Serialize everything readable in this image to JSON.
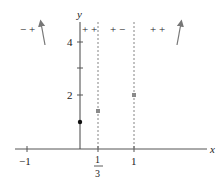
{
  "diagram": {
    "axes": {
      "x_label": "x",
      "y_label": "y",
      "x_ticks": [
        {
          "value": -1,
          "label": "−1"
        },
        {
          "value": 0.3333,
          "label_num": "1",
          "label_den": "3"
        },
        {
          "value": 1,
          "label": "1"
        }
      ],
      "y_ticks": [
        {
          "value": 2,
          "label": "2"
        },
        {
          "value": 3,
          "label": ""
        },
        {
          "value": 4,
          "label": "4"
        }
      ]
    },
    "sign_regions": [
      {
        "label": "− +",
        "region": "x < 0"
      },
      {
        "label": "+ +",
        "region": "0 < x < 1/3"
      },
      {
        "label": "+ −",
        "region": "1/3 < x < 1"
      },
      {
        "label": "+ +",
        "region": "x > 1"
      }
    ],
    "dashed_lines": [
      {
        "x": 0.3333
      },
      {
        "x": 1
      }
    ],
    "points": [
      {
        "x": 0,
        "y": 1,
        "style": "filled-dot",
        "color": "#111111"
      },
      {
        "x": 0.3333,
        "y": 1.4,
        "style": "square",
        "color": "#8a8a8a"
      },
      {
        "x": 1,
        "y": 2,
        "style": "square",
        "color": "#8a8a8a"
      }
    ],
    "arrows": [
      {
        "position": "left",
        "direction": "up-steep"
      },
      {
        "position": "right",
        "direction": "up-steep"
      }
    ]
  }
}
